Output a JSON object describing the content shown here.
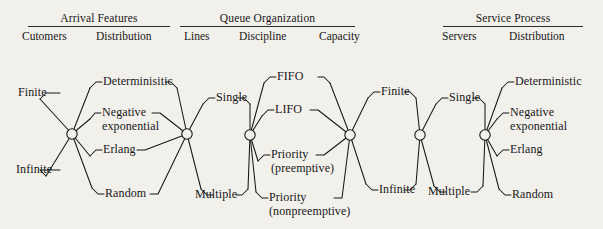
{
  "diagram": {
    "background_color": "#f2f0ea",
    "ink_color": "#17171a"
  },
  "header": {
    "groups": [
      {
        "name": "arrival-features",
        "title": "Arrival Features",
        "subheadings": [
          "Cutomers",
          "Distribution"
        ]
      },
      {
        "name": "queue-organization",
        "title": "Queue Organization",
        "subheadings": [
          "Lines",
          "Discipline",
          "Capacity"
        ]
      },
      {
        "name": "service-process",
        "title": "Service Process",
        "subheadings": [
          "Servers",
          "Distribution"
        ]
      }
    ]
  },
  "columns": {
    "customers": {
      "heading": "Cutomers",
      "options": [
        "Finite",
        "Infinite"
      ]
    },
    "arrival_distribution": {
      "heading": "Distribution",
      "options": [
        "Determinisitic",
        "Negative exponential",
        "Erlang",
        "Random"
      ]
    },
    "lines": {
      "heading": "Lines",
      "options": [
        "Single",
        "Multiple"
      ]
    },
    "discipline": {
      "heading": "Discipline",
      "options": [
        "FIFO",
        "LIFO",
        "Priority (preemptive)",
        "Priority (nonpreemptive)"
      ]
    },
    "capacity": {
      "heading": "Capacity",
      "options": [
        "Finite",
        "Infinite"
      ]
    },
    "servers": {
      "heading": "Servers",
      "options": [
        "Single",
        "Multiple"
      ]
    },
    "service_distribution": {
      "heading": "Distribution",
      "options": [
        "Deterministic",
        "Negative exponential",
        "Erlang",
        "Random"
      ]
    }
  },
  "labels": {
    "finite_1": "Finite",
    "infinite_1": "Infinite",
    "deterministic_1": "Determinisitic",
    "negative_1a": "Negative",
    "negative_1b": "exponential",
    "erlang_1": "Erlang",
    "random_1": "Random",
    "single_1": "Single",
    "multiple_1": "Multiple",
    "fifo": "FIFO",
    "lifo": "LIFO",
    "priority_pre_a": "Priority",
    "priority_pre_b": "(preemptive)",
    "priority_non_a": "Priority",
    "priority_non_b": "(nonpreemptive)",
    "finite_2": "Finite",
    "infinite_2": "Infinite",
    "single_2": "Single",
    "multiple_2": "Multiple",
    "deterministic_2": "Deterministic",
    "negative_2a": "Negative",
    "negative_2b": "exponential",
    "erlang_2": "Erlang",
    "random_2": "Random"
  },
  "nodes": [
    {
      "name": "node-arrival-customers",
      "cx": 72,
      "cy": 134
    },
    {
      "name": "node-arrival-distribution",
      "cx": 187,
      "cy": 134
    },
    {
      "name": "node-queue-lines",
      "cx": 250,
      "cy": 135
    },
    {
      "name": "node-queue-discipline",
      "cx": 350,
      "cy": 135
    },
    {
      "name": "node-queue-capacity",
      "cx": 420,
      "cy": 135
    },
    {
      "name": "node-service-servers",
      "cx": 485,
      "cy": 135
    }
  ]
}
